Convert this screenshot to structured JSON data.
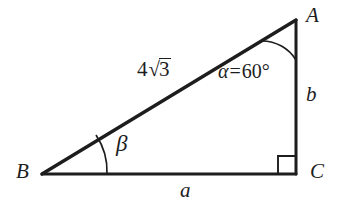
{
  "figure": {
    "type": "right-triangle-geometry-diagram",
    "background_color": "#ffffff",
    "stroke_color": "#1d1d1d",
    "vertices": {
      "A": {
        "label": "A",
        "x": 296,
        "y": 20
      },
      "B": {
        "label": "B",
        "x": 42,
        "y": 174
      },
      "C": {
        "label": "C",
        "x": 296,
        "y": 174
      }
    },
    "sides": {
      "hypotenuse": {
        "name": "AB",
        "label_parts": {
          "coefficient": "4",
          "radical_sign": "√",
          "radicand": "3"
        },
        "label_text": "4√3"
      },
      "vertical": {
        "name": "AC",
        "label": "b"
      },
      "base": {
        "name": "BC",
        "label": "a"
      }
    },
    "angles": {
      "at_A": {
        "symbol": "α",
        "equals": "=",
        "value": "60",
        "degree_sign": "°",
        "label_text": "α = 60°",
        "marker": "arc"
      },
      "at_B": {
        "symbol": "β",
        "label_text": "β",
        "marker": "arc"
      },
      "at_C": {
        "symbol": "",
        "label_text": "",
        "marker": "right-angle-square"
      }
    }
  }
}
